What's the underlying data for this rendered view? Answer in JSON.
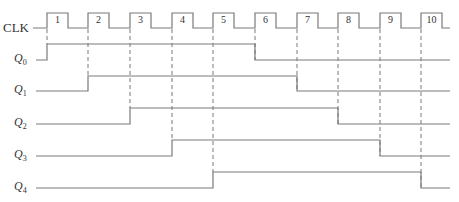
{
  "diagram": {
    "type": "timing-diagram",
    "title": "",
    "clock": {
      "label": "CLK",
      "pulse_numbers": [
        "1",
        "2",
        "3",
        "4",
        "5",
        "6",
        "7",
        "8",
        "9",
        "10"
      ],
      "rising_edges_x": [
        47,
        88,
        130,
        172,
        213,
        255,
        297,
        338,
        380,
        421
      ],
      "pulse_width": 21,
      "y_low": 28,
      "y_high": 13,
      "x_start": 33,
      "x_end": 450
    },
    "signals": [
      {
        "label": "Q",
        "sub": "0",
        "y_low": 60,
        "y_high": 44,
        "rise_x": 47,
        "fall_x": 255,
        "rise_pulse": 1,
        "fall_pulse": 6
      },
      {
        "label": "Q",
        "sub": "1",
        "y_low": 91,
        "y_high": 76,
        "rise_x": 88,
        "fall_x": 297,
        "rise_pulse": 2,
        "fall_pulse": 7
      },
      {
        "label": "Q",
        "sub": "2",
        "y_low": 124,
        "y_high": 108,
        "rise_x": 130,
        "fall_x": 338,
        "rise_pulse": 3,
        "fall_pulse": 8
      },
      {
        "label": "Q",
        "sub": "3",
        "y_low": 156,
        "y_high": 140,
        "rise_x": 172,
        "fall_x": 380,
        "rise_pulse": 4,
        "fall_pulse": 9
      },
      {
        "label": "Q",
        "sub": "4",
        "y_low": 188,
        "y_high": 172,
        "rise_x": 213,
        "fall_x": 421,
        "rise_pulse": 5,
        "fall_pulse": 10
      }
    ],
    "signal_x_start": 36,
    "signal_x_end": 450,
    "colors": {
      "line": "#7a7a7a",
      "dash": "#6a6a6a",
      "text": "#333333"
    }
  }
}
